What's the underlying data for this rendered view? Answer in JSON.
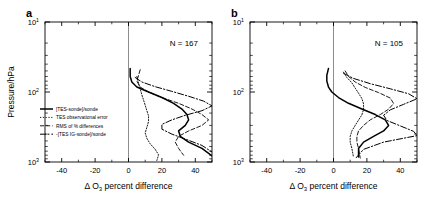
{
  "figure": {
    "panels": [
      {
        "label": "a",
        "n_annotation": "N = 167",
        "xlabel_prefix": "Δ O",
        "xlabel_sub": "3",
        "xlabel_suffix": " percent difference",
        "ylabel": "Pressure/hPa",
        "xticks": [
          "-40",
          "-20",
          "0",
          "20",
          "40"
        ],
        "yticks": [
          "10",
          "10",
          "10"
        ],
        "yexp": [
          "1",
          "2",
          "3"
        ]
      },
      {
        "label": "b",
        "n_annotation": "N = 105",
        "xlabel_prefix": "Δ O",
        "xlabel_sub": "3",
        "xlabel_suffix": " percent difference",
        "ylabel": "",
        "xticks": [
          "-40",
          "-20",
          "0",
          "20",
          "40"
        ],
        "yticks": [
          "10",
          "10",
          "10"
        ],
        "yexp": [
          "1",
          "2",
          "3"
        ]
      }
    ],
    "legend": {
      "items": [
        {
          "label": "[TES-sonde]/sonde",
          "style": "solid"
        },
        {
          "label": "TES observational error",
          "style": "dotted"
        },
        {
          "label": "RMS of % differences",
          "style": "dashed"
        },
        {
          "label": "-[TES IG-sonde]/sonde",
          "style": "dashdot-thick"
        }
      ]
    }
  },
  "chart_data": [
    {
      "type": "line",
      "title": "a",
      "annotation": "N = 167",
      "xlabel": "Δ O3 percent difference",
      "ylabel": "Pressure/hPa",
      "xlim": [
        -50,
        50
      ],
      "ylim": [
        1000,
        10
      ],
      "yscale": "log",
      "grid": false,
      "legend_position": "lower left inside axes",
      "series": [
        {
          "name": "[TES-sonde]/sonde",
          "style": "solid",
          "x": [
            1,
            1,
            2,
            5,
            12,
            20,
            27,
            32,
            35,
            36,
            34,
            30,
            31,
            36,
            44,
            50
          ],
          "pressure": [
            46,
            60,
            72,
            85,
            100,
            120,
            145,
            175,
            210,
            250,
            300,
            360,
            430,
            520,
            640,
            820
          ]
        },
        {
          "name": "TES observational error",
          "style": "dotted",
          "x": [
            5,
            6,
            7,
            8,
            9,
            10,
            11,
            12,
            12,
            11,
            10,
            11,
            13,
            16,
            18,
            17
          ],
          "pressure": [
            60,
            75,
            90,
            110,
            130,
            155,
            185,
            220,
            265,
            320,
            385,
            460,
            550,
            660,
            790,
            950
          ]
        },
        {
          "name": "RMS of % differences",
          "style": "dashed",
          "x": [
            7,
            6,
            5,
            7,
            12,
            20,
            30,
            38,
            44,
            48,
            44,
            36,
            30,
            28,
            30,
            33
          ],
          "pressure": [
            48,
            58,
            70,
            85,
            100,
            120,
            145,
            175,
            210,
            250,
            300,
            360,
            430,
            520,
            640,
            800
          ]
        },
        {
          "name": "-[TES IG-sonde]/sonde",
          "style": "dashdot-thick",
          "x": [
            4,
            8,
            16,
            26,
            36,
            45,
            50,
            44,
            34,
            26,
            20,
            20,
            26,
            35,
            44,
            50
          ],
          "pressure": [
            62,
            72,
            84,
            98,
            115,
            135,
            158,
            185,
            215,
            250,
            290,
            340,
            400,
            480,
            580,
            720
          ]
        }
      ]
    },
    {
      "type": "line",
      "title": "b",
      "annotation": "N = 105",
      "xlabel": "Δ O3 percent difference",
      "ylabel": "",
      "xlim": [
        -50,
        50
      ],
      "ylim": [
        1000,
        10
      ],
      "yscale": "log",
      "grid": false,
      "legend_position": "none",
      "series": [
        {
          "name": "[TES-sonde]/sonde",
          "style": "solid",
          "x": [
            -3,
            -4,
            -4,
            -3,
            -1,
            3,
            9,
            17,
            25,
            31,
            33,
            30,
            24,
            18,
            15,
            15
          ],
          "pressure": [
            46,
            58,
            70,
            85,
            100,
            120,
            145,
            175,
            210,
            250,
            300,
            360,
            430,
            520,
            640,
            850
          ]
        },
        {
          "name": "TES observational error",
          "style": "dotted",
          "x": [
            6,
            8,
            11,
            13,
            15,
            17,
            18,
            18,
            17,
            15,
            13,
            11,
            10,
            10,
            11,
            12
          ],
          "pressure": [
            52,
            62,
            74,
            88,
            104,
            124,
            148,
            178,
            212,
            252,
            300,
            360,
            430,
            520,
            640,
            860
          ]
        },
        {
          "name": "RMS of % differences",
          "style": "dashed",
          "x": [
            7,
            9,
            13,
            19,
            27,
            34,
            36,
            33,
            28,
            22,
            18,
            15,
            14,
            14,
            15,
            16
          ],
          "pressure": [
            50,
            60,
            72,
            86,
            102,
            122,
            146,
            176,
            210,
            250,
            300,
            360,
            430,
            520,
            640,
            880
          ]
        },
        {
          "name": "-[TES IG-sonde]/sonde",
          "style": "dashdot-thick",
          "x": [
            6,
            12,
            22,
            34,
            45,
            50,
            42,
            34,
            30,
            32,
            40,
            48,
            50,
            30,
            18,
            13
          ],
          "pressure": [
            54,
            64,
            76,
            90,
            106,
            125,
            150,
            180,
            215,
            255,
            305,
            365,
            420,
            520,
            660,
            900
          ]
        }
      ]
    }
  ]
}
